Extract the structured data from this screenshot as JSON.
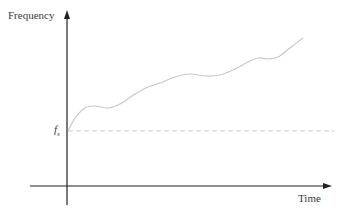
{
  "chart_data": {
    "type": "line",
    "title": "",
    "xlabel": "Time",
    "ylabel": "Frequency",
    "grid": false,
    "legend": null,
    "annotations": [
      {
        "type": "hline",
        "label": "f_s",
        "label_main": "f",
        "label_sub": "s",
        "style": "dashed",
        "description": "reference level f_s"
      }
    ],
    "axis_ticks": {
      "x": [],
      "y": [
        "f_s"
      ]
    },
    "series": [
      {
        "name": "frequency",
        "description": "wavy curve rising from f_s over time",
        "points_px": [
          [
            68,
            131
          ],
          [
            75,
            118
          ],
          [
            85,
            108
          ],
          [
            95,
            106
          ],
          [
            108,
            108
          ],
          [
            120,
            104
          ],
          [
            135,
            94
          ],
          [
            148,
            87
          ],
          [
            160,
            83
          ],
          [
            175,
            77
          ],
          [
            190,
            74
          ],
          [
            205,
            76
          ],
          [
            220,
            75
          ],
          [
            235,
            69
          ],
          [
            248,
            62
          ],
          [
            258,
            58
          ],
          [
            268,
            59
          ],
          [
            278,
            57
          ],
          [
            290,
            48
          ],
          [
            303,
            38
          ]
        ]
      }
    ],
    "colors": {
      "axis": "#222222",
      "curve": "#c8c8c8",
      "reference_line": "#c8c8c8",
      "text": "#3a3a3a"
    }
  },
  "labels": {
    "y_axis": "Frequency",
    "x_axis": "Time",
    "fs_main": "f",
    "fs_sub": "s"
  }
}
